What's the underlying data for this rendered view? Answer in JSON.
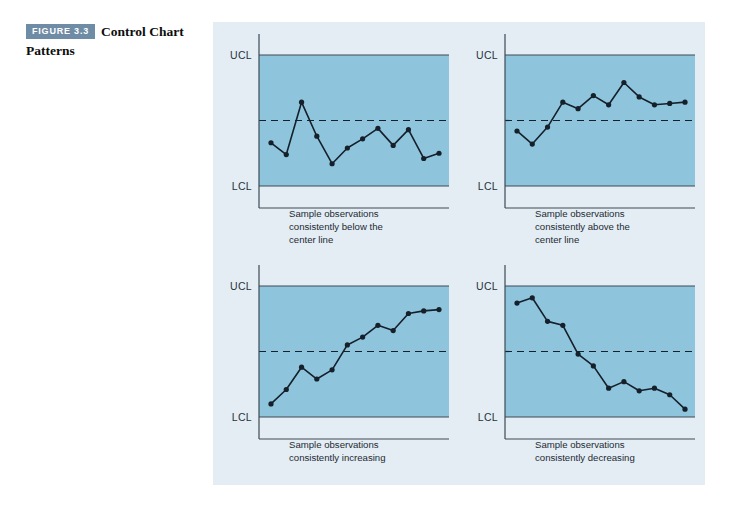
{
  "figure": {
    "badge": "FIGURE 3.3",
    "title": "Control Chart Patterns"
  },
  "colors": {
    "page_background": "#ffffff",
    "panel_background": "#e4edf4",
    "plot_fill": "#8ec4dc",
    "badge_background": "#6f8ca6",
    "line_color": "#15202b",
    "axis_color": "#3c4a54"
  },
  "axis_labels": {
    "ucl": "UCL",
    "lcl": "LCL"
  },
  "chart_data": [
    {
      "type": "line",
      "id": "chart-below-center-line",
      "title": "",
      "caption_lines": [
        "Sample observations",
        "consistently below the",
        "center line"
      ],
      "xlabel": "",
      "ylabel": "",
      "ylim": [
        0,
        100
      ],
      "grid": false,
      "legend": "none",
      "annotations": [
        "UCL",
        "LCL",
        "center line (dashed)"
      ],
      "reference_lines": {
        "ucl": 100,
        "center": 50,
        "lcl": 0
      },
      "x": [
        1,
        2,
        3,
        4,
        5,
        6,
        7,
        8,
        9,
        10,
        11,
        12
      ],
      "values": [
        33,
        24,
        64,
        38,
        17,
        29,
        36,
        44,
        31,
        43,
        21,
        25
      ]
    },
    {
      "type": "line",
      "id": "chart-above-center-line",
      "title": "",
      "caption_lines": [
        "Sample observations",
        "consistently above the",
        "center line"
      ],
      "xlabel": "",
      "ylabel": "",
      "ylim": [
        0,
        100
      ],
      "grid": false,
      "legend": "none",
      "annotations": [
        "UCL",
        "LCL",
        "center line (dashed)"
      ],
      "reference_lines": {
        "ucl": 100,
        "center": 50,
        "lcl": 0
      },
      "x": [
        1,
        2,
        3,
        4,
        5,
        6,
        7,
        8,
        9,
        10,
        11,
        12
      ],
      "values": [
        42,
        32,
        45,
        64,
        59,
        69,
        62,
        79,
        68,
        62,
        63,
        64
      ]
    },
    {
      "type": "line",
      "id": "chart-increasing",
      "title": "",
      "caption_lines": [
        "Sample observations",
        "consistently increasing"
      ],
      "xlabel": "",
      "ylabel": "",
      "ylim": [
        0,
        100
      ],
      "grid": false,
      "legend": "none",
      "annotations": [
        "UCL",
        "LCL",
        "center line (dashed)"
      ],
      "reference_lines": {
        "ucl": 100,
        "center": 50,
        "lcl": 0
      },
      "x": [
        1,
        2,
        3,
        4,
        5,
        6,
        7,
        8,
        9,
        10,
        11,
        12
      ],
      "values": [
        10,
        21,
        38,
        29,
        36,
        55,
        61,
        70,
        66,
        79,
        81,
        82
      ]
    },
    {
      "type": "line",
      "id": "chart-decreasing",
      "title": "",
      "caption_lines": [
        "Sample observations",
        "consistently decreasing"
      ],
      "xlabel": "",
      "ylabel": "",
      "ylim": [
        0,
        100
      ],
      "grid": false,
      "legend": "none",
      "annotations": [
        "UCL",
        "LCL",
        "center line (dashed)"
      ],
      "reference_lines": {
        "ucl": 100,
        "center": 50,
        "lcl": 0
      },
      "x": [
        1,
        2,
        3,
        4,
        5,
        6,
        7,
        8,
        9,
        10,
        11,
        12
      ],
      "values": [
        87,
        91,
        73,
        70,
        48,
        39,
        22,
        27,
        20,
        22,
        17,
        6
      ]
    }
  ]
}
